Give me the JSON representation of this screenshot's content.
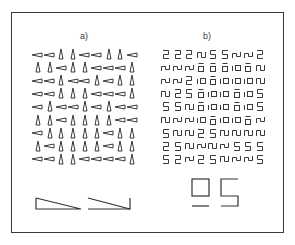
{
  "figure": {
    "panel_a": {
      "label": "a)",
      "legend": "H = horizontal slanted element, V = vertical slanted element",
      "grid": [
        [
          "H",
          "H",
          "V",
          "V",
          "H",
          "H",
          "V",
          "V",
          "H"
        ],
        [
          "V",
          "V",
          "H",
          "V",
          "V",
          "H",
          "H",
          "H",
          "V"
        ],
        [
          "H",
          "H",
          "V",
          "H",
          "H",
          "V",
          "H",
          "V",
          "V"
        ],
        [
          "H",
          "H",
          "V",
          "V",
          "V",
          "H",
          "H",
          "H",
          "V"
        ],
        [
          "H",
          "V",
          "H",
          "H",
          "V",
          "H",
          "V",
          "H",
          "H"
        ],
        [
          "V",
          "V",
          "H",
          "V",
          "V",
          "V",
          "V",
          "H",
          "H"
        ],
        [
          "H",
          "V",
          "V",
          "V",
          "V",
          "V",
          "H",
          "V",
          "V"
        ],
        [
          "V",
          "H",
          "V",
          "V",
          "V",
          "V",
          "H",
          "V",
          "V"
        ],
        [
          "H",
          "H",
          "V",
          "V",
          "H",
          "H",
          "H",
          "H",
          "V"
        ]
      ],
      "elements": [
        "left-right-triangle",
        "right-right-triangle"
      ]
    },
    "panel_b": {
      "label": "b)",
      "legend": "2 = digit two, 5 = digit five, S = wave-S glyph, N = wave-N glyph, O = square-over-bar, I = bar-square pair",
      "grid": [
        [
          "2",
          "2",
          "2",
          "S",
          "5",
          "5",
          "N",
          "N",
          "2"
        ],
        [
          "N",
          "N",
          "N",
          "O",
          "O",
          "O",
          "I",
          "O",
          "S"
        ],
        [
          "N",
          "N",
          "2",
          "I",
          "O",
          "I",
          "I",
          "I",
          "S"
        ],
        [
          "S",
          "2",
          "5",
          "O",
          "I",
          "I",
          "O",
          "I",
          "5"
        ],
        [
          "5",
          "5",
          "S",
          "O",
          "I",
          "I",
          "O",
          "I",
          "5"
        ],
        [
          "S",
          "N",
          "N",
          "I",
          "O",
          "I",
          "I",
          "O",
          "N"
        ],
        [
          "5",
          "S",
          "S",
          "2",
          "5",
          "S",
          "S",
          "S",
          "S"
        ],
        [
          "2",
          "5",
          "S",
          "N",
          "S",
          "N",
          "5",
          "5",
          "5"
        ],
        [
          "5",
          "2",
          "N",
          "2",
          "5",
          "S",
          "N",
          "N",
          "5"
        ]
      ],
      "elements": [
        "square-over-bar",
        "five-shape"
      ]
    }
  }
}
